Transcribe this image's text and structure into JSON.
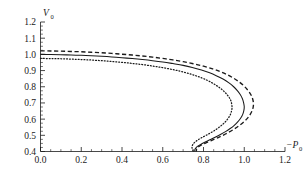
{
  "chart_data": {
    "type": "line",
    "title": "",
    "xlabel": "-P0",
    "xlabel_main": "−P",
    "xlabel_sub": "0",
    "ylabel": "V0",
    "ylabel_main": "V",
    "ylabel_sub": "0",
    "xlim": [
      0.0,
      1.2
    ],
    "ylim": [
      0.4,
      1.2
    ],
    "xticks": [
      0.0,
      0.2,
      0.4,
      0.6,
      0.8,
      1.0,
      1.2
    ],
    "xtick_labels": [
      "0.0",
      "0.2",
      "0.4",
      "0.6",
      "0.8",
      "1.0",
      "1.2"
    ],
    "yticks": [
      0.4,
      0.5,
      0.6,
      0.7,
      0.8,
      0.9,
      1.0,
      1.1,
      1.2
    ],
    "ytick_labels": [
      "0.4",
      "0.5",
      "0.6",
      "0.7",
      "0.8",
      "0.9",
      "1.0",
      "1.1",
      "1.2"
    ],
    "xminor_step": 0.05,
    "yminor_step": 0.025,
    "grid": false,
    "legend": false,
    "legend_position": "none",
    "frame": "left-bottom",
    "series": [
      {
        "name": "dashed-curve",
        "style": "dashed",
        "color": "#1a1a1a",
        "max_x": 1.045,
        "max_x_at_y": 0.72,
        "start_point": [
          0.0,
          1.022
        ],
        "points": [
          [
            0.0,
            1.022
          ],
          [
            0.05,
            1.021
          ],
          [
            0.1,
            1.02
          ],
          [
            0.15,
            1.018
          ],
          [
            0.2,
            1.016
          ],
          [
            0.25,
            1.013
          ],
          [
            0.3,
            1.01
          ],
          [
            0.35,
            1.006
          ],
          [
            0.4,
            1.001
          ],
          [
            0.45,
            0.996
          ],
          [
            0.5,
            0.99
          ],
          [
            0.55,
            0.983
          ],
          [
            0.6,
            0.975
          ],
          [
            0.65,
            0.966
          ],
          [
            0.7,
            0.955
          ],
          [
            0.75,
            0.942
          ],
          [
            0.8,
            0.927
          ],
          [
            0.845,
            0.91
          ],
          [
            0.885,
            0.892
          ],
          [
            0.92,
            0.872
          ],
          [
            0.95,
            0.851
          ],
          [
            0.977,
            0.828
          ],
          [
            1.0,
            0.803
          ],
          [
            1.018,
            0.778
          ],
          [
            1.032,
            0.752
          ],
          [
            1.041,
            0.726
          ],
          [
            1.045,
            0.7
          ],
          [
            1.044,
            0.675
          ],
          [
            1.038,
            0.65
          ],
          [
            1.028,
            0.626
          ],
          [
            1.014,
            0.603
          ],
          [
            0.996,
            0.581
          ],
          [
            0.975,
            0.56
          ],
          [
            0.952,
            0.54
          ],
          [
            0.927,
            0.521
          ],
          [
            0.9,
            0.503
          ],
          [
            0.872,
            0.486
          ],
          [
            0.843,
            0.47
          ],
          [
            0.815,
            0.455
          ],
          [
            0.793,
            0.443
          ],
          [
            0.778,
            0.432
          ],
          [
            0.77,
            0.424
          ],
          [
            0.766,
            0.415
          ],
          [
            0.765,
            0.405
          ],
          [
            0.765,
            0.4
          ]
        ]
      },
      {
        "name": "solid-curve",
        "style": "solid",
        "color": "#1a1a1a",
        "max_x": 1.0,
        "max_x_at_y": 0.73,
        "start_point": [
          0.0,
          1.0
        ],
        "points": [
          [
            0.0,
            1.0
          ],
          [
            0.05,
            0.999
          ],
          [
            0.1,
            0.998
          ],
          [
            0.15,
            0.996
          ],
          [
            0.2,
            0.994
          ],
          [
            0.25,
            0.991
          ],
          [
            0.3,
            0.988
          ],
          [
            0.35,
            0.984
          ],
          [
            0.4,
            0.979
          ],
          [
            0.45,
            0.974
          ],
          [
            0.5,
            0.968
          ],
          [
            0.55,
            0.961
          ],
          [
            0.6,
            0.953
          ],
          [
            0.65,
            0.943
          ],
          [
            0.7,
            0.932
          ],
          [
            0.745,
            0.919
          ],
          [
            0.79,
            0.903
          ],
          [
            0.83,
            0.886
          ],
          [
            0.865,
            0.867
          ],
          [
            0.898,
            0.846
          ],
          [
            0.925,
            0.824
          ],
          [
            0.948,
            0.8
          ],
          [
            0.966,
            0.776
          ],
          [
            0.981,
            0.751
          ],
          [
            0.991,
            0.726
          ],
          [
            0.997,
            0.701
          ],
          [
            1.0,
            0.676
          ],
          [
            0.998,
            0.652
          ],
          [
            0.992,
            0.628
          ],
          [
            0.982,
            0.605
          ],
          [
            0.968,
            0.583
          ],
          [
            0.951,
            0.562
          ],
          [
            0.931,
            0.542
          ],
          [
            0.908,
            0.523
          ],
          [
            0.883,
            0.505
          ],
          [
            0.857,
            0.488
          ],
          [
            0.831,
            0.472
          ],
          [
            0.806,
            0.457
          ],
          [
            0.786,
            0.444
          ],
          [
            0.772,
            0.433
          ],
          [
            0.763,
            0.423
          ],
          [
            0.758,
            0.413
          ],
          [
            0.757,
            0.404
          ],
          [
            0.757,
            0.4
          ]
        ]
      },
      {
        "name": "dotted-curve",
        "style": "dotted",
        "color": "#1a1a1a",
        "max_x": 0.94,
        "max_x_at_y": 0.72,
        "start_point": [
          0.0,
          0.975
        ],
        "points": [
          [
            0.0,
            0.975
          ],
          [
            0.05,
            0.974
          ],
          [
            0.1,
            0.973
          ],
          [
            0.15,
            0.971
          ],
          [
            0.2,
            0.968
          ],
          [
            0.25,
            0.965
          ],
          [
            0.3,
            0.961
          ],
          [
            0.35,
            0.956
          ],
          [
            0.4,
            0.951
          ],
          [
            0.45,
            0.944
          ],
          [
            0.5,
            0.937
          ],
          [
            0.55,
            0.928
          ],
          [
            0.6,
            0.918
          ],
          [
            0.65,
            0.906
          ],
          [
            0.695,
            0.893
          ],
          [
            0.74,
            0.877
          ],
          [
            0.78,
            0.86
          ],
          [
            0.818,
            0.84
          ],
          [
            0.85,
            0.818
          ],
          [
            0.878,
            0.795
          ],
          [
            0.901,
            0.771
          ],
          [
            0.919,
            0.746
          ],
          [
            0.932,
            0.721
          ],
          [
            0.938,
            0.696
          ],
          [
            0.94,
            0.671
          ],
          [
            0.937,
            0.647
          ],
          [
            0.93,
            0.623
          ],
          [
            0.918,
            0.6
          ],
          [
            0.903,
            0.578
          ],
          [
            0.885,
            0.558
          ],
          [
            0.864,
            0.538
          ],
          [
            0.84,
            0.519
          ],
          [
            0.816,
            0.502
          ],
          [
            0.792,
            0.486
          ],
          [
            0.772,
            0.471
          ],
          [
            0.757,
            0.457
          ],
          [
            0.748,
            0.444
          ],
          [
            0.744,
            0.432
          ],
          [
            0.744,
            0.42
          ],
          [
            0.747,
            0.409
          ],
          [
            0.75,
            0.4
          ]
        ]
      }
    ]
  }
}
